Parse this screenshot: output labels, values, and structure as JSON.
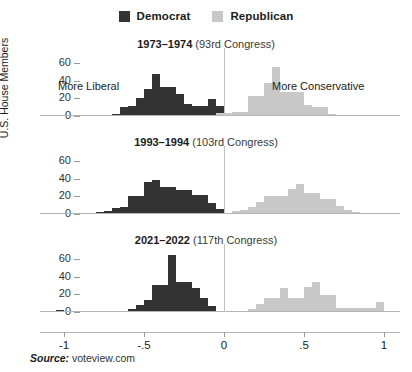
{
  "legend": {
    "entries": [
      {
        "label": "Democrat",
        "color": "#333333"
      },
      {
        "label": "Republican",
        "color": "#c8c8c8"
      }
    ]
  },
  "axis": {
    "ylabel": "U.S. House Members",
    "yticks": [
      "0",
      "20",
      "40",
      "60"
    ],
    "ytick_values": [
      0,
      20,
      40,
      60
    ],
    "ylim": [
      0,
      70
    ],
    "xticks": [
      "-1",
      "-.5",
      "0",
      ".5",
      "1"
    ],
    "xtick_values": [
      -1,
      -0.5,
      0,
      0.5,
      1
    ],
    "xlim": [
      -1.15,
      1.1
    ]
  },
  "annotations": {
    "left": "More Liberal",
    "right": "More Conservative"
  },
  "source": {
    "prefix": "Source:",
    "value": "voteview.com"
  },
  "panels": [
    {
      "title_bold": "1973–1974",
      "title_rest": "(93rd Congress)",
      "show_annotations": true
    },
    {
      "title_bold": "1993–1994",
      "title_rest": "(103rd Congress)",
      "show_annotations": false
    },
    {
      "title_bold": "2021–2022",
      "title_rest": "(117th Congress)",
      "show_annotations": false
    }
  ],
  "chart_data": {
    "type": "bar",
    "subtitle": "",
    "xlabel": "",
    "ylabel": "U.S. House Members",
    "xlim": [
      -1.15,
      1.1
    ],
    "ylim": [
      0,
      70
    ],
    "grid": false,
    "legend_position": "top-center",
    "bin_width": 0.05,
    "x_axis_note": "DW-NOMINATE first dimension score",
    "panels": [
      {
        "name": "1973–1974 (93rd Congress)",
        "series": [
          {
            "name": "Democrat",
            "color": "#333333",
            "bins": [
              -0.7,
              -0.65,
              -0.6,
              -0.55,
              -0.5,
              -0.45,
              -0.4,
              -0.35,
              -0.3,
              -0.25,
              -0.2,
              -0.15,
              -0.1,
              -0.05
            ],
            "values": [
              2,
              10,
              11,
              20,
              31,
              48,
              33,
              33,
              25,
              14,
              11,
              11,
              19,
              11
            ]
          },
          {
            "name": "Republican",
            "color": "#c8c8c8",
            "bins": [
              -0.05,
              0.0,
              0.05,
              0.1,
              0.15,
              0.2,
              0.25,
              0.3,
              0.35,
              0.4,
              0.45,
              0.5,
              0.55,
              0.6,
              0.65,
              0.7
            ],
            "values": [
              3,
              3,
              4,
              4,
              23,
              23,
              37,
              55,
              27,
              27,
              27,
              12,
              10,
              10,
              2,
              1
            ]
          }
        ]
      },
      {
        "name": "1993–1994 (103rd Congress)",
        "series": [
          {
            "name": "Democrat",
            "color": "#333333",
            "bins": [
              -0.8,
              -0.75,
              -0.7,
              -0.65,
              -0.6,
              -0.55,
              -0.5,
              -0.45,
              -0.4,
              -0.35,
              -0.3,
              -0.25,
              -0.2,
              -0.15,
              -0.1,
              -0.05
            ],
            "values": [
              2,
              3,
              7,
              8,
              20,
              20,
              36,
              38,
              30,
              30,
              27,
              27,
              22,
              22,
              13,
              6
            ]
          },
          {
            "name": "Republican",
            "color": "#c8c8c8",
            "bins": [
              0.05,
              0.1,
              0.15,
              0.2,
              0.25,
              0.3,
              0.35,
              0.4,
              0.45,
              0.5,
              0.55,
              0.6,
              0.65,
              0.7,
              0.75,
              0.8
            ],
            "values": [
              3,
              4,
              8,
              14,
              20,
              20,
              20,
              28,
              34,
              24,
              24,
              17,
              17,
              9,
              5,
              2
            ]
          }
        ]
      },
      {
        "name": "2021–2022 (117th Congress)",
        "series": [
          {
            "name": "Democrat",
            "color": "#333333",
            "bins": [
              -1.05,
              -0.6,
              -0.55,
              -0.5,
              -0.45,
              -0.4,
              -0.35,
              -0.3,
              -0.25,
              -0.2,
              -0.15,
              -0.1
            ],
            "values": [
              2,
              3,
              8,
              14,
              31,
              31,
              64,
              34,
              34,
              27,
              16,
              7
            ]
          },
          {
            "name": "Republican",
            "color": "#c8c8c8",
            "bins": [
              0.15,
              0.2,
              0.25,
              0.3,
              0.35,
              0.4,
              0.45,
              0.5,
              0.55,
              0.6,
              0.65,
              0.7,
              0.75,
              0.8,
              0.85,
              0.9,
              0.95
            ],
            "values": [
              3,
              9,
              16,
              16,
              27,
              16,
              16,
              28,
              34,
              19,
              19,
              5,
              4,
              4,
              4,
              4,
              11
            ]
          }
        ]
      }
    ]
  }
}
